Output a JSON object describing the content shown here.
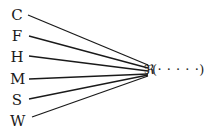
{
  "diagram": {
    "sources": [
      {
        "label": "C",
        "y": 15
      },
      {
        "label": "F",
        "y": 36
      },
      {
        "label": "H",
        "y": 57
      },
      {
        "label": "M",
        "y": 79
      },
      {
        "label": "S",
        "y": 100
      },
      {
        "label": "W",
        "y": 121
      }
    ],
    "target_symbol": "ℜ",
    "target_args": "(· · · · ·)",
    "line_color": "#1a1a1a"
  }
}
